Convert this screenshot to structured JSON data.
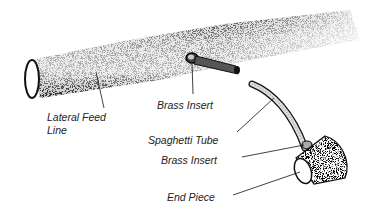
{
  "diagram": {
    "labels": {
      "lateral_feed_line": [
        "Lateral Feed",
        "Line"
      ],
      "brass_insert_top": "Brass Insert",
      "spaghetti_tube": "Spaghetti Tube",
      "brass_insert_bottom": "Brass Insert",
      "end_piece": "End Piece"
    },
    "colors": {
      "ink": "#1a1a1a",
      "background": "#ffffff"
    }
  }
}
